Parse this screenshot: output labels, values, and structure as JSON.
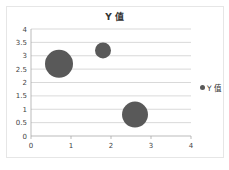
{
  "chart_data": {
    "type": "bubble",
    "title": "Y 值",
    "xlabel": "",
    "ylabel": "",
    "xlim": [
      0,
      4
    ],
    "ylim": [
      0,
      4
    ],
    "x_ticks": [
      "0",
      "1",
      "2",
      "3",
      "4"
    ],
    "y_ticks": [
      "0",
      "0.5",
      "1",
      "1.5",
      "2",
      "2.5",
      "3",
      "3.5",
      "4"
    ],
    "grid": "horizontal",
    "legend_position": "right",
    "series": [
      {
        "name": "Y 值",
        "color": "#595959",
        "points": [
          {
            "x": 0.7,
            "y": 2.7,
            "size": 14
          },
          {
            "x": 1.8,
            "y": 3.2,
            "size": 8
          },
          {
            "x": 2.6,
            "y": 0.8,
            "size": 13
          }
        ]
      }
    ]
  },
  "legend": {
    "label": "Y 值"
  }
}
